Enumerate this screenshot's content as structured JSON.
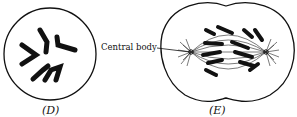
{
  "figure": {
    "panels": [
      {
        "id": "D",
        "caption": "(D)",
        "description": "cell with condensed chromosomes"
      },
      {
        "id": "E",
        "caption": "(E)",
        "description": "dividing cell with spindle and chromosomes"
      }
    ],
    "annotations": [
      {
        "label": "Central body",
        "target": "E"
      }
    ],
    "colors": {
      "ink": "#111111",
      "background": "#ffffff"
    }
  }
}
